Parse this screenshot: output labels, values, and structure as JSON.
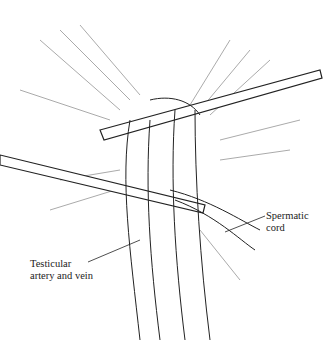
{
  "figure": {
    "labels": {
      "spermatic_cord": {
        "line1": "Spermatic",
        "line2": "cord"
      },
      "testicular_vessels": {
        "line1": "Testicular",
        "line2": "artery and vein"
      }
    },
    "colors": {
      "ink": "#222222",
      "background": "#ffffff"
    }
  }
}
